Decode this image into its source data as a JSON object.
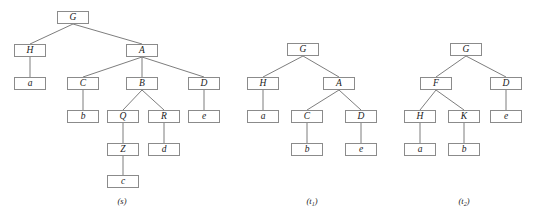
{
  "figure": {
    "width": 533,
    "height": 220,
    "background": "#ffffff",
    "node_border_color": "#8b8b8b",
    "edge_color": "#6e6e6e",
    "text_color": "#1a1a1a"
  },
  "trees": [
    {
      "id": "s",
      "caption": "(s)",
      "caption_x": 122,
      "caption_y": 196,
      "nodes": [
        {
          "name": "s-G",
          "label": "G",
          "x": 57,
          "y": 11
        },
        {
          "name": "s-H",
          "label": "H",
          "x": 14,
          "y": 44
        },
        {
          "name": "s-A",
          "label": "A",
          "x": 126,
          "y": 44
        },
        {
          "name": "s-a",
          "label": "a",
          "x": 14,
          "y": 77
        },
        {
          "name": "s-C",
          "label": "C",
          "x": 67,
          "y": 77
        },
        {
          "name": "s-B",
          "label": "B",
          "x": 126,
          "y": 77
        },
        {
          "name": "s-D",
          "label": "D",
          "x": 188,
          "y": 77
        },
        {
          "name": "s-b",
          "label": "b",
          "x": 67,
          "y": 110
        },
        {
          "name": "s-Q",
          "label": "Q",
          "x": 107,
          "y": 110
        },
        {
          "name": "s-R",
          "label": "R",
          "x": 148,
          "y": 110
        },
        {
          "name": "s-e",
          "label": "e",
          "x": 188,
          "y": 110
        },
        {
          "name": "s-Z",
          "label": "Z",
          "x": 107,
          "y": 143
        },
        {
          "name": "s-d",
          "label": "d",
          "x": 148,
          "y": 143
        },
        {
          "name": "s-c",
          "label": "c",
          "x": 107,
          "y": 175
        }
      ],
      "edges": [
        [
          "s-G",
          "s-H"
        ],
        [
          "s-G",
          "s-A"
        ],
        [
          "s-H",
          "s-a"
        ],
        [
          "s-A",
          "s-C"
        ],
        [
          "s-A",
          "s-B"
        ],
        [
          "s-A",
          "s-D"
        ],
        [
          "s-C",
          "s-b"
        ],
        [
          "s-B",
          "s-Q"
        ],
        [
          "s-B",
          "s-R"
        ],
        [
          "s-D",
          "s-e"
        ],
        [
          "s-Q",
          "s-Z"
        ],
        [
          "s-R",
          "s-d"
        ],
        [
          "s-Z",
          "s-c"
        ]
      ]
    },
    {
      "id": "t1",
      "caption": "(t₁)",
      "caption_text": "(t",
      "caption_sub": "1",
      "caption_tail": ")",
      "caption_x": 312,
      "caption_y": 196,
      "nodes": [
        {
          "name": "t1-G",
          "label": "G",
          "x": 287,
          "y": 43
        },
        {
          "name": "t1-H",
          "label": "H",
          "x": 247,
          "y": 77
        },
        {
          "name": "t1-A",
          "label": "A",
          "x": 323,
          "y": 77
        },
        {
          "name": "t1-a",
          "label": "a",
          "x": 247,
          "y": 110
        },
        {
          "name": "t1-C",
          "label": "C",
          "x": 291,
          "y": 110
        },
        {
          "name": "t1-D",
          "label": "D",
          "x": 345,
          "y": 110
        },
        {
          "name": "t1-b",
          "label": "b",
          "x": 291,
          "y": 143
        },
        {
          "name": "t1-e",
          "label": "e",
          "x": 345,
          "y": 143
        }
      ],
      "edges": [
        [
          "t1-G",
          "t1-H"
        ],
        [
          "t1-G",
          "t1-A"
        ],
        [
          "t1-H",
          "t1-a"
        ],
        [
          "t1-A",
          "t1-C"
        ],
        [
          "t1-A",
          "t1-D"
        ],
        [
          "t1-C",
          "t1-b"
        ],
        [
          "t1-D",
          "t1-e"
        ]
      ]
    },
    {
      "id": "t2",
      "caption": "(t₂)",
      "caption_text": "(t",
      "caption_sub": "2",
      "caption_tail": ")",
      "caption_x": 464,
      "caption_y": 196,
      "nodes": [
        {
          "name": "t2-G",
          "label": "G",
          "x": 450,
          "y": 43
        },
        {
          "name": "t2-F",
          "label": "F",
          "x": 420,
          "y": 77
        },
        {
          "name": "t2-D",
          "label": "D",
          "x": 490,
          "y": 77
        },
        {
          "name": "t2-H",
          "label": "H",
          "x": 404,
          "y": 110
        },
        {
          "name": "t2-K",
          "label": "K",
          "x": 448,
          "y": 110
        },
        {
          "name": "t2-e",
          "label": "e",
          "x": 490,
          "y": 110
        },
        {
          "name": "t2-a",
          "label": "a",
          "x": 404,
          "y": 143
        },
        {
          "name": "t2-b",
          "label": "b",
          "x": 448,
          "y": 143
        }
      ],
      "edges": [
        [
          "t2-G",
          "t2-F"
        ],
        [
          "t2-G",
          "t2-D"
        ],
        [
          "t2-F",
          "t2-H"
        ],
        [
          "t2-F",
          "t2-K"
        ],
        [
          "t2-D",
          "t2-e"
        ],
        [
          "t2-H",
          "t2-a"
        ],
        [
          "t2-K",
          "t2-b"
        ]
      ]
    }
  ]
}
